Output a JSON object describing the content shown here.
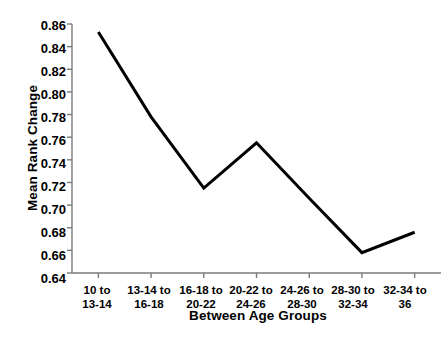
{
  "chart_data": {
    "type": "line",
    "title": "",
    "xlabel": "Between Age Groups",
    "ylabel": "Mean Rank Change",
    "categories": [
      "10 to\n13-14",
      "13-14 to\n16-18",
      "16-18 to\n20-22",
      "20-22 to\n24-26",
      "24-26 to\n28-30",
      "28-30 to\n32-34",
      "32-34 to\n36"
    ],
    "category_lines": [
      [
        "10 to",
        "13-14"
      ],
      [
        "13-14 to",
        "16-18"
      ],
      [
        "16-18 to",
        "20-22"
      ],
      [
        "20-22 to",
        "24-26"
      ],
      [
        "24-26 to",
        "28-30"
      ],
      [
        "28-30 to",
        "32-34"
      ],
      [
        "32-34 to",
        "36"
      ]
    ],
    "values": [
      0.853,
      0.778,
      0.715,
      0.755,
      0.706,
      0.658,
      0.676
    ],
    "ylim": [
      0.64,
      0.86
    ],
    "ytick_values": [
      0.64,
      0.66,
      0.68,
      0.7,
      0.72,
      0.74,
      0.76,
      0.78,
      0.8,
      0.82,
      0.84,
      0.86
    ],
    "ytick_labels": [
      "0.64",
      "0.66",
      "0.68",
      "0.70",
      "0.72",
      "0.74",
      "0.76",
      "0.78",
      "0.80",
      "0.82",
      "0.84",
      "0.86"
    ],
    "grid": false,
    "legend": null,
    "series": [
      {
        "name": "Mean Rank Change",
        "values": [
          0.853,
          0.778,
          0.715,
          0.755,
          0.706,
          0.658,
          0.676
        ],
        "color": "#000000",
        "line_width": 3,
        "markers": false
      }
    ],
    "axes": {
      "left_spine": true,
      "bottom_spine": true,
      "top_spine": false,
      "right_spine": false,
      "tick_direction": "out"
    }
  }
}
